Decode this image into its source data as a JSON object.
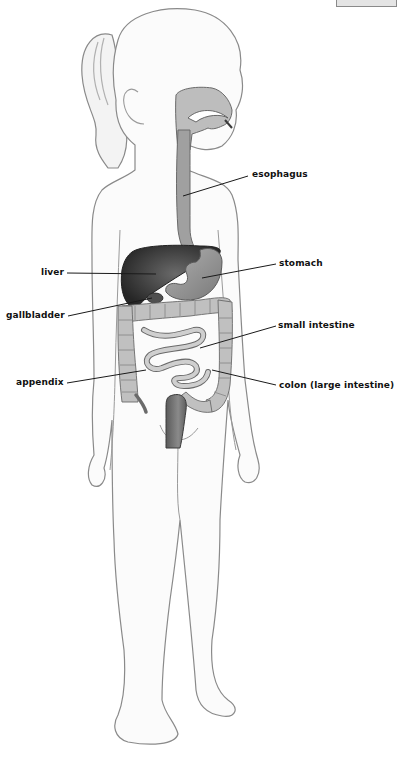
{
  "diagram": {
    "labels": {
      "esophagus": "esophagus",
      "liver": "liver",
      "stomach": "stomach",
      "gallbladder": "gallbladder",
      "small_intestine": "small intestine",
      "appendix": "appendix",
      "colon": "colon (large intestine)"
    },
    "colors": {
      "outline": "#7a7a7a",
      "skin": "#fafafa",
      "liver": "#3a3a3a",
      "stomach": "#8e8e8e",
      "intestine": "#b4b4b4",
      "esophagus": "#9a9a9a",
      "leader": "#1a1a1a"
    }
  }
}
